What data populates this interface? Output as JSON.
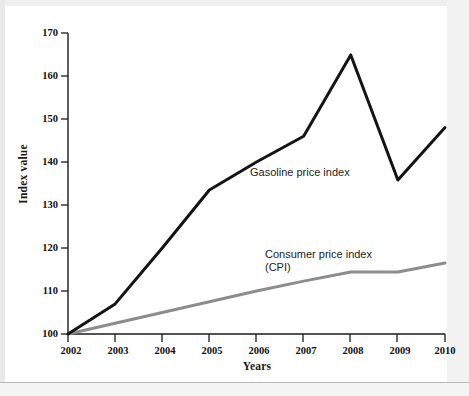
{
  "figure": {
    "background_color": "#ffffff"
  },
  "chart_data": {
    "type": "line",
    "title": "",
    "xlabel": "Years",
    "ylabel": "Index value",
    "x": [
      "2002",
      "2003",
      "2004",
      "2005",
      "2006",
      "2007",
      "2008",
      "2009",
      "2010"
    ],
    "categories": [
      "2002",
      "2003",
      "2004",
      "2005",
      "2006",
      "2007",
      "2008",
      "2009",
      "2010"
    ],
    "xlim": [
      "2002",
      "2010"
    ],
    "ylim": [
      100,
      170
    ],
    "ytick_labels": [
      "100",
      "110",
      "120",
      "130",
      "140",
      "150",
      "160",
      "170"
    ],
    "ytick_values": [
      100,
      110,
      120,
      130,
      140,
      150,
      160,
      170
    ],
    "ytick_step": 10,
    "grid": false,
    "legend_position": "inline-annotation",
    "series": [
      {
        "name": "Gasoline price index",
        "color": "#141414",
        "line_width": 3,
        "values": [
          100,
          107,
          120,
          133.5,
          140,
          146,
          164.9,
          135.8,
          148
        ]
      },
      {
        "name": "Consumer price index (CPI)",
        "color": "#8c8c8c",
        "line_width": 3,
        "values": [
          100,
          102.5,
          105,
          107.5,
          110,
          112.3,
          114.4,
          114.4,
          116.5
        ]
      }
    ],
    "annotations": [
      {
        "id": "gasoline",
        "text": "Gasoline price index"
      },
      {
        "id": "cpi",
        "text": "Consumer price index\n(CPI)"
      }
    ]
  },
  "axes": {
    "y_title": "Index value",
    "x_title": "Years",
    "y_ticks": [
      {
        "label": "170"
      },
      {
        "label": "160"
      },
      {
        "label": "150"
      },
      {
        "label": "140"
      },
      {
        "label": "130"
      },
      {
        "label": "120"
      },
      {
        "label": "110"
      },
      {
        "label": "100"
      }
    ],
    "x_ticks": [
      {
        "label": "2002"
      },
      {
        "label": "2003"
      },
      {
        "label": "2004"
      },
      {
        "label": "2005"
      },
      {
        "label": "2006"
      },
      {
        "label": "2007"
      },
      {
        "label": "2008"
      },
      {
        "label": "2009"
      },
      {
        "label": "2010"
      }
    ]
  },
  "annotations": {
    "gasoline": "Gasoline price index",
    "cpi_line1": "Consumer price index",
    "cpi_line2": "(CPI)"
  }
}
